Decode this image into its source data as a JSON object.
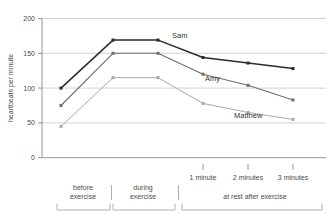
{
  "chart_data": {
    "type": "line",
    "title": "",
    "xlabel": "",
    "ylabel": "heartbeats per minute",
    "ylim": [
      0,
      200
    ],
    "yticks": [
      0,
      50,
      100,
      150,
      200
    ],
    "ytick_labels": [
      "0",
      "50",
      "100",
      "150",
      "200"
    ],
    "grid": true,
    "legend": "inline-labels",
    "categories": [
      "before exercise",
      "during exercise start",
      "during exercise end",
      "1 minute",
      "2 minutes",
      "3 minutes"
    ],
    "xtick_labels": [
      "1 minute",
      "2 minutes",
      "3 minutes"
    ],
    "group_labels": [
      "before exercise",
      "during exercise",
      "at rest after exercise"
    ],
    "series": [
      {
        "name": "Sam",
        "color": "#2b2b2b",
        "values": [
          100,
          169,
          169,
          144,
          136,
          128
        ]
      },
      {
        "name": "Amy",
        "color": "#6e6e6e",
        "values": [
          75,
          150,
          150,
          120,
          104,
          83
        ]
      },
      {
        "name": "Matthew",
        "color": "#a8a8a8",
        "values": [
          45,
          115,
          115,
          78,
          65,
          55
        ]
      }
    ]
  },
  "axis": {
    "y_title": "heartbeats per minute",
    "y_labels": {
      "t200": "200",
      "t150": "150",
      "t100": "100",
      "t50": "50",
      "t0": "0"
    }
  },
  "x_axis": {
    "tick_1": "1 minute",
    "tick_2": "2 minutes",
    "tick_3": "3 minutes"
  },
  "groups": {
    "before_line1": "before",
    "before_line2": "exercise",
    "during_line1": "during",
    "during_line2": "exercise",
    "rest": "at rest after exercise"
  },
  "series_labels": {
    "sam": "Sam",
    "amy": "Amy",
    "matthew": "Matthew"
  }
}
